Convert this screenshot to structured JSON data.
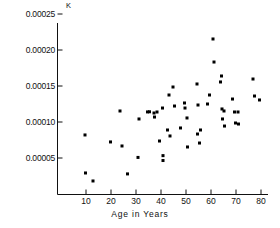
{
  "chart_data": {
    "type": "scatter",
    "title": "",
    "ylabel": "K",
    "xlabel": "Age in Years",
    "xlim": [
      4,
      82
    ],
    "ylim": [
      0,
      0.00025
    ],
    "grid": false,
    "legend": null,
    "xticks": [
      10,
      20,
      30,
      40,
      50,
      60,
      70,
      80
    ],
    "xticklabels": [
      "10",
      "20",
      "30",
      "40",
      "50",
      "60",
      "70",
      "80"
    ],
    "yticks": [
      5e-05,
      0.0001,
      0.00015,
      0.0002,
      0.00025
    ],
    "yticklabels": [
      "0.00005",
      "0.00010",
      "0.00015",
      "0.00020",
      "0.00025"
    ],
    "marker": "filled-square",
    "marker_color": "#000000",
    "marker_size": 3,
    "series": [
      {
        "name": "observations",
        "points": [
          [
            9.6,
            8.2e-05
          ],
          [
            9.8,
            2.92e-05
          ],
          [
            12.8,
            1.81e-05
          ],
          [
            19.8,
            7.23e-05
          ],
          [
            23.6,
            0.0001153
          ],
          [
            24.4,
            6.67e-05
          ],
          [
            26.6,
            2.79e-05
          ],
          [
            30.8,
            5.08e-05
          ],
          [
            31.2,
            0.0001042
          ],
          [
            34.6,
            0.000114
          ],
          [
            35.4,
            0.0001142
          ],
          [
            37.2,
            0.0001125
          ],
          [
            37.4,
            0.0001069
          ],
          [
            38.4,
            0.0001139
          ],
          [
            39.4,
            7.36e-05
          ],
          [
            40.6,
            0.0001194
          ],
          [
            40.8,
            5.33e-05
          ],
          [
            40.8,
            4.65e-05
          ],
          [
            42.6,
            8.89e-05
          ],
          [
            43.2,
            0.0001375
          ],
          [
            43.6,
            8.06e-05
          ],
          [
            44.8,
            0.0001486
          ],
          [
            45.4,
            0.0001222
          ],
          [
            47.8,
            9.17e-05
          ],
          [
            49.4,
            0.0001264
          ],
          [
            49.6,
            0.0001194
          ],
          [
            50.4,
            0.0001056
          ],
          [
            50.6,
            6.53e-05
          ],
          [
            54.4,
            0.0001528
          ],
          [
            54.6,
            8.33e-05
          ],
          [
            54.8,
            0.0001236
          ],
          [
            55.4,
            7.08e-05
          ],
          [
            55.8,
            8.89e-05
          ],
          [
            58.6,
            0.000125
          ],
          [
            59.4,
            0.0001375
          ],
          [
            60.8,
            0.0002153
          ],
          [
            61.2,
            0.0001833
          ],
          [
            63.8,
            0.0001556
          ],
          [
            64.2,
            0.0001639
          ],
          [
            64.4,
            0.0001181
          ],
          [
            64.6,
            0.0001042
          ],
          [
            65.2,
            0.0001153
          ],
          [
            65.4,
            9.44e-05
          ],
          [
            68.6,
            0.0001319
          ],
          [
            69.4,
            0.0001139
          ],
          [
            69.8,
            9.86e-05
          ],
          [
            70.8,
            0.0001139
          ],
          [
            71.0,
            9.72e-05
          ],
          [
            76.8,
            0.0001597
          ],
          [
            77.4,
            0.0001361
          ],
          [
            79.4,
            0.0001306
          ]
        ]
      }
    ]
  },
  "axis": {
    "y_axis_title": "K",
    "x_axis_title": "Age in Years"
  }
}
